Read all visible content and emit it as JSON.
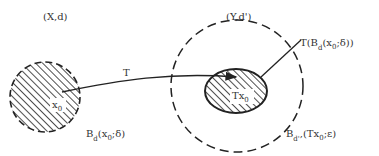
{
  "diagram": {
    "spaces": {
      "domain_label": "(X,d)",
      "codomain_label": "(Y,d')"
    },
    "map": {
      "label": "T"
    },
    "domain_ball": {
      "label_main": "B",
      "label_sub": "d",
      "label_args_pre": "(x",
      "label_args_sub": "0",
      "label_args_post": ";δ)",
      "center_label_main": "x",
      "center_label_sub": "0"
    },
    "image_set": {
      "label_pre": "T(B",
      "label_sub": "d",
      "label_args_pre": "(x",
      "label_args_sub": "0",
      "label_args_post": ";δ))",
      "center_label_main": "Tx",
      "center_label_sub": "0"
    },
    "codomain_ball": {
      "label_main": "B",
      "label_sub": "d'",
      "label_args_pre": ",(Tx",
      "label_args_sub": "0",
      "label_args_post": ";ε)"
    },
    "colors": {
      "ink": "#222222",
      "text": "#333333",
      "background": "#ffffff"
    }
  }
}
